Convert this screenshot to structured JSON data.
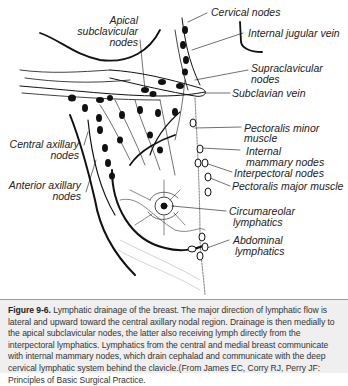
{
  "figure": {
    "title": "Lymphatic drainage of the breast",
    "labels": {
      "cervical_nodes": "Cervical nodes",
      "internal_jugular_vein": "Internal jugular vein",
      "apical_subclavicular_1": "Apical",
      "apical_subclavicular_2": "subclavicular",
      "apical_subclavicular_3": "nodes",
      "supraclavicular_1": "Supraclavicular",
      "supraclavicular_2": "nodes",
      "subclavian_vein": "Subclavian vein",
      "pectoralis_minor_1": "Pectoralis minor",
      "pectoralis_minor_2": "muscle",
      "central_axillary_1": "Central axillary",
      "central_axillary_2": "nodes",
      "internal_mammary_1": "Internal",
      "internal_mammary_2": "mammary nodes",
      "interpectoral_nodes": "Interpectoral nodes",
      "anterior_axillary_1": "Anterior axillary",
      "anterior_axillary_2": "nodes",
      "pectoralis_major_muscle": "Pectoralis major muscle",
      "circumareolar_1": "Circumareolar",
      "circumareolar_2": "lymphatics",
      "abdominal_1": "Abdominal",
      "abdominal_2": "lymphatics"
    }
  },
  "caption": {
    "figure_number": "Figure 9-6.",
    "text": " Lymphatic drainage of the breast. The major direction of lymphatic flow is lateral and upward toward the central axillary nodal region. Drainage is then medially to the apical subclavicular nodes, the latter also receiving lymph directly from the interpectoral lymphatics. Lymphatics from the central and medial breast communicate with internal mammary nodes, which drain cephalad and communicate with the deep cervical lymphatic system behind the clavicle.(From James EC, Corry RJ, Perry JF: Principles of Basic Surgical Practice."
  }
}
